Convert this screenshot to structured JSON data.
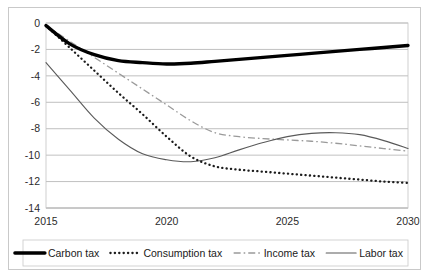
{
  "chart_data": {
    "type": "line",
    "title": "",
    "xlabel": "",
    "ylabel": "",
    "xlim": [
      2015,
      2030
    ],
    "ylim": [
      -14,
      0
    ],
    "grid": true,
    "grid_axis": "y",
    "legend_position": "bottom",
    "xticks": [
      "2015",
      "2020",
      "2025",
      "2030"
    ],
    "xtick_values": [
      2015,
      2020,
      2025,
      2030
    ],
    "yticks": [
      "0",
      "-2",
      "-4",
      "-6",
      "-8",
      "-10",
      "-12",
      "-14"
    ],
    "ytick_values": [
      0,
      -2,
      -4,
      -6,
      -8,
      -10,
      -12,
      -14
    ],
    "x": [
      2015,
      2016,
      2017,
      2018,
      2019,
      2020,
      2021,
      2022,
      2023,
      2024,
      2025,
      2026,
      2027,
      2028,
      2029,
      2030
    ],
    "series": [
      {
        "name": "Carbon tax",
        "style": "thick-solid",
        "color": "#000000",
        "values": [
          -0.2,
          -1.6,
          -2.4,
          -2.85,
          -3.0,
          -3.1,
          -3.05,
          -2.9,
          -2.75,
          -2.6,
          -2.45,
          -2.3,
          -2.15,
          -2.0,
          -1.85,
          -1.7
        ]
      },
      {
        "name": "Consumption tax",
        "style": "dotted",
        "color": "#1c1c1c",
        "values": [
          -0.2,
          -1.9,
          -3.6,
          -5.3,
          -6.9,
          -8.6,
          -10.1,
          -10.85,
          -11.1,
          -11.25,
          -11.4,
          -11.55,
          -11.7,
          -11.85,
          -12.0,
          -12.1
        ]
      },
      {
        "name": "Income tax",
        "style": "dash-dot",
        "color": "#9a9a9a",
        "values": [
          -0.2,
          -1.4,
          -2.6,
          -3.8,
          -5.0,
          -6.2,
          -7.4,
          -8.3,
          -8.6,
          -8.75,
          -8.85,
          -8.95,
          -9.1,
          -9.3,
          -9.5,
          -9.7
        ]
      },
      {
        "name": "Labor tax",
        "style": "thin-solid",
        "color": "#5a5a5a",
        "values": [
          -3.0,
          -5.1,
          -7.2,
          -8.8,
          -9.9,
          -10.35,
          -10.5,
          -10.2,
          -9.6,
          -9.05,
          -8.6,
          -8.35,
          -8.3,
          -8.45,
          -8.9,
          -9.5
        ]
      }
    ]
  },
  "legend": {
    "items": [
      {
        "label": "Carbon tax",
        "style": "thick-solid"
      },
      {
        "label": "Consumption tax",
        "style": "dotted"
      },
      {
        "label": "Income tax",
        "style": "dash-dot"
      },
      {
        "label": "Labor tax",
        "style": "thin-solid"
      }
    ]
  }
}
